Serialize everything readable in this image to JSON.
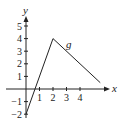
{
  "chart_data": {
    "type": "line",
    "title": "",
    "xlabel": "x",
    "ylabel": "y",
    "series": [
      {
        "name": "g",
        "x": [
          0,
          2,
          5.5
        ],
        "y": [
          -2,
          4,
          0.5
        ]
      }
    ],
    "curve_label": "g",
    "x_ticks": [
      "1",
      "2",
      "3",
      "4"
    ],
    "y_ticks": [
      "-2",
      "-1",
      "1",
      "2",
      "3",
      "4",
      "5"
    ],
    "xlim": [
      -1.5,
      7
    ],
    "ylim": [
      -2.2,
      6
    ],
    "grid": false,
    "legend": "none"
  },
  "axes": {
    "x_label": "x",
    "y_label": "y"
  }
}
